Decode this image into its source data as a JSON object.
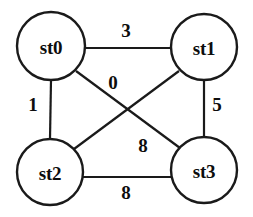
{
  "figure": {
    "type": "undirected-weighted-graph",
    "background_color": "#ffffff",
    "stroke_color": "#1a1a1a",
    "text_color": "#0d0d0d"
  },
  "chart_data": {
    "type": "diagram",
    "title": "",
    "nodes": [
      {
        "id": "n0",
        "label": "st0",
        "cx": 51,
        "cy": 46,
        "r": 34
      },
      {
        "id": "n1",
        "label": "st1",
        "cx": 204,
        "cy": 47,
        "r": 33
      },
      {
        "id": "n2",
        "label": "st2",
        "cx": 50,
        "cy": 172,
        "r": 33
      },
      {
        "id": "n3",
        "label": "st3",
        "cx": 204,
        "cy": 170,
        "r": 33
      }
    ],
    "edges": [
      {
        "id": "e0",
        "from": "st0",
        "to": "st1",
        "weight": "3",
        "x1": 85,
        "y1": 48,
        "x2": 171,
        "y2": 48,
        "label_x": 126,
        "label_y": 30
      },
      {
        "id": "e1",
        "from": "st0",
        "to": "st2",
        "weight": "1",
        "x1": 51,
        "y1": 80,
        "x2": 50,
        "y2": 139,
        "label_x": 33,
        "label_y": 104
      },
      {
        "id": "e2",
        "from": "st1",
        "to": "st3",
        "weight": "5",
        "x1": 204,
        "y1": 80,
        "x2": 204,
        "y2": 137,
        "label_x": 217,
        "label_y": 104
      },
      {
        "id": "e3",
        "from": "st2",
        "to": "st3",
        "weight": "8",
        "x1": 83,
        "y1": 177,
        "x2": 171,
        "y2": 177,
        "label_x": 126,
        "label_y": 192
      },
      {
        "id": "e4",
        "from": "st0",
        "to": "st3",
        "weight": "0",
        "x1": 76,
        "y1": 71,
        "x2": 180,
        "y2": 148,
        "label_x": 113,
        "label_y": 82
      },
      {
        "id": "e5",
        "from": "st1",
        "to": "st2",
        "weight": "8",
        "x1": 179,
        "y1": 71,
        "x2": 74,
        "y2": 149,
        "label_x": 143,
        "label_y": 145
      }
    ]
  }
}
